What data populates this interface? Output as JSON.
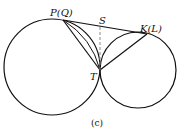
{
  "figure": {
    "caption": "(c)",
    "labels": {
      "P": "P(Q)",
      "S": "S",
      "K": "K(L)",
      "T": "T"
    },
    "stroke_color": "#111111",
    "dashed_color": "#888888"
  }
}
